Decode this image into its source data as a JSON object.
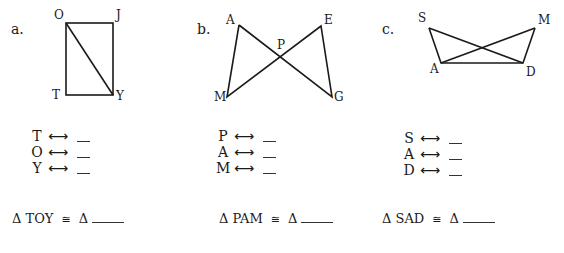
{
  "problems": [
    {
      "label": "a.",
      "figure": "rectangle with diagonal",
      "vertices": {
        "O": [
          66,
          23
        ],
        "J": [
          113,
          23
        ],
        "T": [
          66,
          95
        ],
        "Y": [
          113,
          95
        ]
      },
      "vertex_labels": [
        "O",
        "J",
        "T",
        "Y"
      ],
      "correspondences": [
        {
          "from": "T",
          "arrow": "⟷",
          "answer": ""
        },
        {
          "from": "O",
          "arrow": "⟷",
          "answer": ""
        },
        {
          "from": "Y",
          "arrow": "⟷",
          "answer": ""
        }
      ],
      "congruence": {
        "delta": "Δ",
        "triangle": "TOY",
        "symbol": "≅",
        "delta2": "Δ",
        "answer": ""
      }
    },
    {
      "label": "b.",
      "figure": "bowtie (crossed segments)",
      "vertices": {
        "A": [
          239,
          25
        ],
        "E": [
          321,
          26
        ],
        "P": [
          280,
          58
        ],
        "M": [
          227,
          97
        ],
        "G": [
          332,
          97
        ]
      },
      "vertex_labels": [
        "A",
        "E",
        "P",
        "M",
        "G"
      ],
      "correspondences": [
        {
          "from": "P",
          "arrow": "⟷",
          "answer": ""
        },
        {
          "from": "A",
          "arrow": "⟷",
          "answer": ""
        },
        {
          "from": "M",
          "arrow": "⟷",
          "answer": ""
        }
      ],
      "congruence": {
        "delta": "Δ",
        "triangle": "PAM",
        "symbol": "≅",
        "delta2": "Δ",
        "answer": ""
      }
    },
    {
      "label": "c.",
      "figure": "overlapping triangles on shared base",
      "vertices": {
        "S": [
          429,
          28
        ],
        "M": [
          535,
          28
        ],
        "A": [
          441,
          63
        ],
        "D": [
          523,
          63
        ]
      },
      "vertex_labels": [
        "S",
        "M",
        "A",
        "D"
      ],
      "correspondences": [
        {
          "from": "S",
          "arrow": "⟷",
          "answer": ""
        },
        {
          "from": "A",
          "arrow": "⟷",
          "answer": ""
        },
        {
          "from": "D",
          "arrow": "⟷",
          "answer": ""
        }
      ],
      "congruence": {
        "delta": "Δ",
        "triangle": "SAD",
        "symbol": "≅",
        "delta2": "Δ",
        "answer": ""
      }
    }
  ],
  "colors": {
    "ink": "#1a1a1a",
    "background": "#ffffff"
  }
}
